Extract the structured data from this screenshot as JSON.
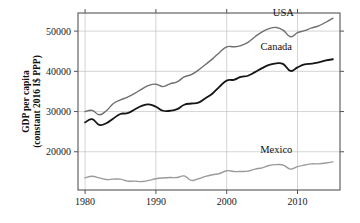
{
  "chart_data": {
    "type": "line",
    "title": "",
    "subtitle": "",
    "xlabel": "",
    "ylabel": "GDP per capita (constant 2016 I$ PPP)",
    "ylabel_line1": "GDP per capita",
    "ylabel_line2": "(constant 2016 I$ PPP)",
    "xlim": [
      1979,
      2016
    ],
    "ylim": [
      10500,
      54500
    ],
    "xticks": [
      1980,
      1990,
      2000,
      2010
    ],
    "xtick_labels": [
      "1980",
      "1990",
      "2000",
      "2010"
    ],
    "yticks": [
      20000,
      30000,
      40000,
      50000
    ],
    "ytick_labels": [
      "20000",
      "30000",
      "40000",
      "50000"
    ],
    "grid": true,
    "grid_color": "#b9b9b9",
    "frame_color": "#555555",
    "legend_position": "inline-labels",
    "x": [
      1980,
      1981,
      1982,
      1983,
      1984,
      1985,
      1986,
      1987,
      1988,
      1989,
      1990,
      1991,
      1992,
      1993,
      1994,
      1995,
      1996,
      1997,
      1998,
      1999,
      2000,
      2001,
      2002,
      2003,
      2004,
      2005,
      2006,
      2007,
      2008,
      2009,
      2010,
      2011,
      2012,
      2013,
      2014,
      2015
    ],
    "series": [
      {
        "name": "USA",
        "color": "#6f6f6f",
        "width": 1.4,
        "label": "USA",
        "label_x": 2008,
        "label_y": 53800,
        "values": [
          30000,
          30300,
          29200,
          30200,
          32000,
          32900,
          33600,
          34500,
          35600,
          36500,
          36800,
          36200,
          36900,
          37400,
          38600,
          39200,
          40300,
          41700,
          43100,
          44700,
          46100,
          46100,
          46400,
          47200,
          48600,
          49800,
          50600,
          50900,
          50200,
          48600,
          49600,
          50100,
          50800,
          51300,
          52200,
          53200
        ]
      },
      {
        "name": "Canada",
        "color": "#161616",
        "width": 1.8,
        "label": "Canada",
        "label_x": 2007,
        "label_y": 45200,
        "values": [
          27300,
          28100,
          26700,
          27100,
          28300,
          29400,
          29600,
          30500,
          31400,
          31800,
          31200,
          30200,
          30200,
          30600,
          31700,
          32000,
          32200,
          33300,
          34500,
          36200,
          37700,
          37900,
          38600,
          38900,
          39800,
          40800,
          41600,
          42000,
          41800,
          40100,
          41000,
          41700,
          41900,
          42200,
          42700,
          43000
        ]
      },
      {
        "name": "Mexico",
        "color": "#9b9b9b",
        "width": 1.4,
        "label": "Mexico",
        "label_x": 2007,
        "label_y": 19700,
        "values": [
          13500,
          13900,
          13500,
          13100,
          13200,
          13200,
          12700,
          12700,
          12600,
          12900,
          13300,
          13500,
          13600,
          13600,
          14000,
          12900,
          13300,
          13900,
          14300,
          14600,
          15300,
          15100,
          15100,
          15200,
          15700,
          16000,
          16600,
          16800,
          16700,
          15700,
          16300,
          16700,
          17000,
          17000,
          17200,
          17500
        ]
      }
    ]
  }
}
